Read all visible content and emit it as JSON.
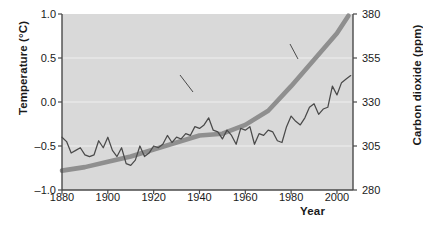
{
  "chart_data": {
    "type": "line",
    "title": "",
    "xlabel": "Year",
    "ylabel": "Temperature (°C)",
    "y2label": "Carbon dioxide (ppm)",
    "xlim": [
      1880,
      2007
    ],
    "ylim": [
      -1.0,
      1.0
    ],
    "y2lim": [
      280,
      380
    ],
    "grid": true,
    "legend_position": "inline-annotations",
    "xticks": [
      "1880",
      "1900",
      "1920",
      "1940",
      "1960",
      "1980",
      "2000"
    ],
    "xtick_values": [
      1880,
      1900,
      1920,
      1940,
      1960,
      1980,
      2000
    ],
    "yticks": [
      "1.0",
      "0.5",
      "0.0",
      "–0.5",
      "–1.0"
    ],
    "ytick_values": [
      1.0,
      0.5,
      0.0,
      -0.5,
      -1.0
    ],
    "y2ticks": [
      "380",
      "355",
      "330",
      "305",
      "280"
    ],
    "y2tick_values": [
      380,
      355,
      330,
      305,
      280
    ],
    "annotations": [
      {
        "text_line1": "Global",
        "text_line2": "temperature",
        "target_series": "Global temperature"
      },
      {
        "text_line1": "Carbon",
        "text_line2": "dioxide",
        "target_series": "Carbon dioxide"
      }
    ],
    "series": [
      {
        "name": "Global temperature",
        "axis": "left",
        "units": "°C",
        "style": "thin-jagged-line",
        "color": "#4a4a4a",
        "x": [
          1880,
          1882,
          1884,
          1886,
          1888,
          1890,
          1892,
          1894,
          1896,
          1898,
          1900,
          1902,
          1904,
          1906,
          1908,
          1910,
          1912,
          1914,
          1916,
          1918,
          1920,
          1922,
          1924,
          1926,
          1928,
          1930,
          1932,
          1934,
          1936,
          1938,
          1940,
          1942,
          1944,
          1946,
          1948,
          1950,
          1952,
          1954,
          1956,
          1958,
          1960,
          1962,
          1964,
          1966,
          1968,
          1970,
          1972,
          1974,
          1976,
          1978,
          1980,
          1982,
          1984,
          1986,
          1988,
          1990,
          1992,
          1994,
          1996,
          1998,
          2000,
          2002,
          2004,
          2006
        ],
        "values": [
          -0.4,
          -0.45,
          -0.58,
          -0.55,
          -0.52,
          -0.6,
          -0.62,
          -0.6,
          -0.44,
          -0.52,
          -0.4,
          -0.55,
          -0.62,
          -0.52,
          -0.7,
          -0.72,
          -0.66,
          -0.5,
          -0.62,
          -0.58,
          -0.5,
          -0.52,
          -0.48,
          -0.38,
          -0.46,
          -0.4,
          -0.42,
          -0.36,
          -0.38,
          -0.28,
          -0.3,
          -0.26,
          -0.18,
          -0.32,
          -0.34,
          -0.42,
          -0.32,
          -0.38,
          -0.48,
          -0.3,
          -0.32,
          -0.28,
          -0.48,
          -0.36,
          -0.38,
          -0.32,
          -0.34,
          -0.44,
          -0.46,
          -0.28,
          -0.16,
          -0.22,
          -0.26,
          -0.18,
          -0.06,
          -0.02,
          -0.14,
          -0.08,
          -0.06,
          0.18,
          0.08,
          0.22,
          0.26,
          0.3
        ]
      },
      {
        "name": "Carbon dioxide",
        "axis": "right",
        "units": "ppm",
        "style": "thick-smooth-line",
        "color": "#8c8c8c",
        "x": [
          1880,
          1890,
          1900,
          1910,
          1920,
          1930,
          1940,
          1950,
          1960,
          1970,
          1980,
          1990,
          2000,
          2005
        ],
        "values": [
          291,
          293,
          296,
          299,
          303,
          307,
          311,
          312,
          317,
          325,
          339,
          354,
          369,
          379
        ]
      }
    ]
  },
  "axes": {
    "left_title": "Temperature (°C)",
    "right_title": "Carbon dioxide (ppm)",
    "x_title": "Year"
  },
  "annotations": {
    "temperature": {
      "line1": "Global",
      "line2": "temperature"
    },
    "co2": {
      "line1": "Carbon",
      "line2": "dioxide"
    }
  },
  "colors": {
    "plot_background": "#d9d9d9",
    "gridline": "#f2f2f2",
    "axis": "#4a4a4a",
    "temperature_line": "#4a4a4a",
    "co2_line": "#8f8f8f",
    "text": "#1a1a1a"
  }
}
